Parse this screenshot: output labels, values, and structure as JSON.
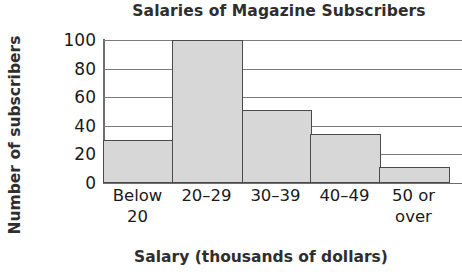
{
  "chart_data": {
    "type": "bar",
    "title": "Salaries of Magazine Subscribers",
    "xlabel": "Salary (thousands of dollars)",
    "ylabel": "Number of subscribers",
    "categories": [
      "Below 20",
      "20–29",
      "30–39",
      "40–49",
      "50 or over"
    ],
    "category_lines": [
      [
        "Below",
        "20"
      ],
      [
        "20–29"
      ],
      [
        "30–39"
      ],
      [
        "40–49"
      ],
      [
        "50 or",
        "over"
      ]
    ],
    "values": [
      30,
      100,
      51,
      34,
      11
    ],
    "ylim": [
      0,
      100
    ],
    "yticks": [
      0,
      20,
      40,
      60,
      80,
      100
    ],
    "ytick_labels": [
      "0",
      "20",
      "40",
      "60",
      "80",
      "100"
    ],
    "grid": "horizontal",
    "legend": "none",
    "bar_fill_color": "#d7d7d7",
    "bar_edge_color": "#4a4a4a",
    "gridline_color": "#7c7c7c",
    "axis_color": "#6e6e6e",
    "title_color": "#2e2e2e",
    "tick_label_color": "#1a1a1a",
    "histogram_style": true
  }
}
